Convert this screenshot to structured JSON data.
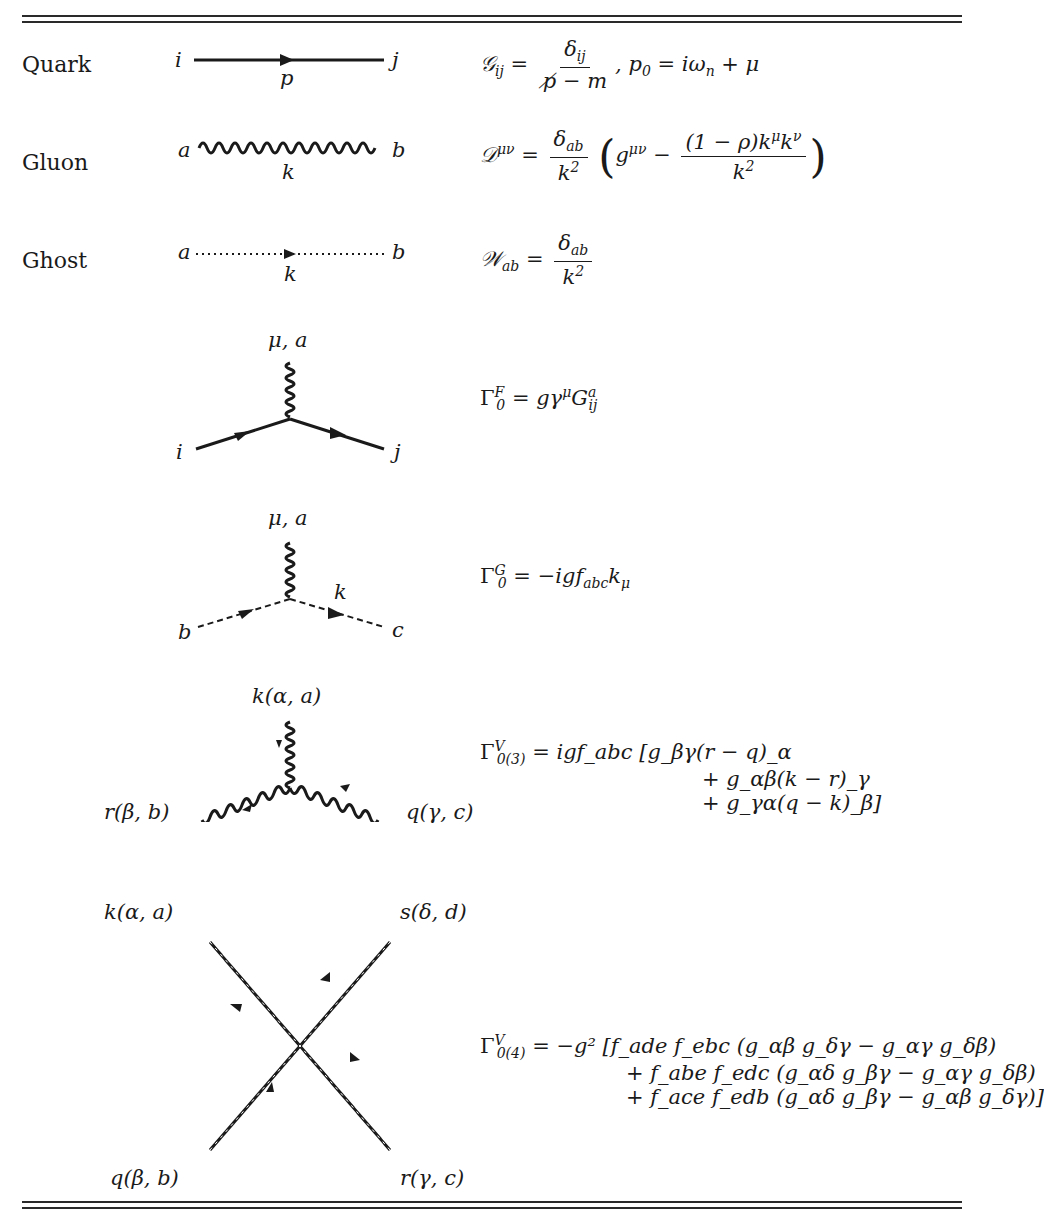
{
  "table": {
    "rows": [
      {
        "label": "Quark",
        "endpoints": [
          "i",
          "j"
        ],
        "momentum": "p",
        "formula": {
          "lhs": "𝒢",
          "lhs_sub": "ij",
          "eq": "=",
          "num": "δ",
          "num_sub": "ij",
          "den": "p̸ − m",
          "tail": ", p",
          "tail_sub": "0",
          "tail_rest": " = iω",
          "tail_rest_sub": "n",
          "tail_end": " + μ"
        }
      },
      {
        "label": "Gluon",
        "endpoints": [
          "a",
          "b"
        ],
        "momentum": "k",
        "formula": {
          "lhs": "𝒟",
          "lhs_sup": "μν",
          "num": "δ",
          "num_sub": "ab",
          "den": "k",
          "den_sup": "2",
          "inner_g": "g",
          "inner_g_sup": "μν",
          "inner_num": "(1 − ρ)k",
          "inner_num_sup1": "μ",
          "inner_num_mid": "k",
          "inner_num_sup2": "ν",
          "inner_den": "k",
          "inner_den_sup": "2"
        }
      },
      {
        "label": "Ghost",
        "endpoints": [
          "a",
          "b"
        ],
        "momentum": "k",
        "formula": {
          "lhs": "𝒲",
          "lhs_sub": "ab",
          "num": "δ",
          "num_sub": "ab",
          "den": "k",
          "den_sup": "2"
        }
      }
    ],
    "vertices": [
      {
        "name": "quark-gluon",
        "labels": {
          "top": "μ, a",
          "left": "i",
          "right": "j"
        },
        "formula": {
          "gamma": "Γ",
          "sub": "0",
          "sup": "F",
          "rhs": " = gγ",
          "rhs_sup": "μ",
          "rhs2": "G",
          "rhs2_sup": "a",
          "rhs2_sub": "ij"
        }
      },
      {
        "name": "ghost-gluon",
        "labels": {
          "top": "μ, a",
          "left": "b",
          "right": "c",
          "momentum": "k"
        },
        "formula": {
          "gamma": "Γ",
          "sub": "0",
          "sup": "G",
          "rhs": " = −igf",
          "rhs_sub": "abc",
          "rhs2": "k",
          "rhs2_sub": "μ"
        }
      },
      {
        "name": "three-gluon",
        "labels": {
          "top": "k(α, a)",
          "left": "r(β, b)",
          "right": "q(γ, c)"
        },
        "formula": {
          "gamma": "Γ",
          "sub": "0(3)",
          "sup": "V",
          "lines": [
            "= igf_abc [g_βγ(r − q)_α",
            "+ g_αβ(k − r)_γ",
            "+ g_γα(q − k)_β]"
          ]
        }
      },
      {
        "name": "four-gluon",
        "labels": {
          "top_left": "k(α, a)",
          "top_right": "s(δ, d)",
          "bottom_left": "q(β, b)",
          "bottom_right": "r(γ, c)"
        },
        "formula": {
          "gamma": "Γ",
          "sub": "0(4)",
          "sup": "V",
          "lines": [
            "= −g² [f_ade f_ebc (g_αβ g_δγ − g_αγ g_δβ)",
            "+ f_abe f_edc (g_αδ g_βγ − g_αγ g_δβ)",
            "+ f_ace f_edb (g_αδ g_βγ − g_αβ g_δγ)]"
          ]
        }
      }
    ]
  }
}
